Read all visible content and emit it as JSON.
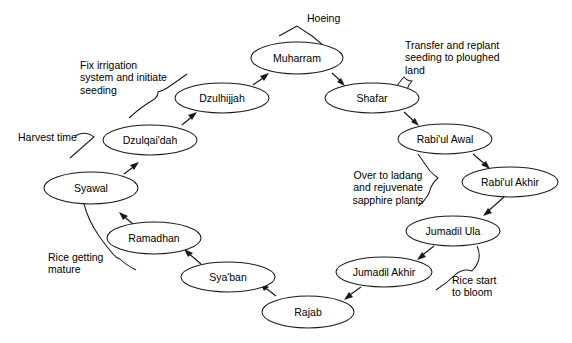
{
  "diagram": {
    "type": "cycle-diagram",
    "background_color": "#ffffff",
    "node_fill_color": "#ffffff",
    "node_stroke_color": "#1a1a1a",
    "text_color": "#000000",
    "nodes": [
      {
        "id": "muharram",
        "label": "Muharram",
        "cx": 297,
        "cy": 58,
        "rx": 46,
        "ry": 16
      },
      {
        "id": "shafar",
        "label": "Shafar",
        "cx": 372,
        "cy": 98,
        "rx": 47,
        "ry": 15
      },
      {
        "id": "rabiul-awal",
        "label": "Rabi'ul Awal",
        "cx": 445,
        "cy": 139,
        "rx": 47,
        "ry": 15
      },
      {
        "id": "rabiul-akhir",
        "label": "Rabi'ul Akhir",
        "cx": 510,
        "cy": 182,
        "rx": 48,
        "ry": 15
      },
      {
        "id": "jumadil-ula",
        "label": "Jumadil Ula",
        "cx": 453,
        "cy": 231,
        "rx": 47,
        "ry": 15
      },
      {
        "id": "jumadil-akhir",
        "label": "Jumadil Akhir",
        "cx": 384,
        "cy": 272,
        "rx": 48,
        "ry": 15
      },
      {
        "id": "rajab",
        "label": "Rajab",
        "cx": 308,
        "cy": 312,
        "rx": 46,
        "ry": 16
      },
      {
        "id": "syaban",
        "label": "Sya'ban",
        "cx": 228,
        "cy": 277,
        "rx": 47,
        "ry": 15
      },
      {
        "id": "ramadhan",
        "label": "Ramadhan",
        "cx": 154,
        "cy": 238,
        "rx": 47,
        "ry": 16
      },
      {
        "id": "syawal",
        "label": "Syawal",
        "cx": 91,
        "cy": 188,
        "rx": 47,
        "ry": 16
      },
      {
        "id": "dzulqaidah",
        "label": "Dzulqai'dah",
        "cx": 150,
        "cy": 140,
        "rx": 47,
        "ry": 15
      },
      {
        "id": "dzulhijjah",
        "label": "Dzulhijjah",
        "cx": 222,
        "cy": 98,
        "rx": 47,
        "ry": 15
      }
    ],
    "flow_order": [
      "muharram",
      "shafar",
      "rabiul-awal",
      "rabiul-akhir",
      "jumadil-ula",
      "jumadil-akhir",
      "rajab",
      "syaban",
      "ramadhan",
      "syawal",
      "dzulqaidah",
      "dzulhijjah",
      "muharram"
    ],
    "annotations": [
      {
        "id": "hoeing",
        "text": "Hoeing",
        "lines": [
          "Hoeing"
        ],
        "align": "left",
        "x": 307,
        "y": 12,
        "attached_to": "muharram"
      },
      {
        "id": "transfer-replant",
        "text": "Transfer and replant seeding to ploughed land",
        "lines": [
          "Transfer and replant",
          "seeding to ploughed",
          "land"
        ],
        "align": "left",
        "x": 405,
        "y": 39,
        "attached_to": "shafar"
      },
      {
        "id": "over-to-ladang",
        "text": "Over to ladang and rejuvenate sapphire plants",
        "lines": [
          "Over to ladang",
          "and rejuvenate",
          "sapphire plants"
        ],
        "align": "center",
        "x": 338,
        "y": 169,
        "attached_to": "rabiul-akhir"
      },
      {
        "id": "rice-start-bloom",
        "text": "Rice start to bloom",
        "lines": [
          "Rice start",
          "to bloom"
        ],
        "align": "left",
        "x": 452,
        "y": 274,
        "attached_to": "jumadil-ula"
      },
      {
        "id": "rice-getting-mature",
        "text": "Rice getting mature",
        "lines": [
          "Rice getting",
          "mature"
        ],
        "align": "left",
        "x": 48,
        "y": 251,
        "attached_to": "syawal"
      },
      {
        "id": "harvest-time",
        "text": "Harvest time",
        "lines": [
          "Harvest time"
        ],
        "align": "left",
        "x": 18,
        "y": 131,
        "attached_to": "syawal"
      },
      {
        "id": "fix-irrigation",
        "text": "Fix irrigation system and initiate seeding",
        "lines": [
          "Fix irrigation",
          "system and initiate",
          "seeding"
        ],
        "align": "left",
        "x": 80,
        "y": 59,
        "attached_to": "dzulqaidah"
      }
    ]
  }
}
